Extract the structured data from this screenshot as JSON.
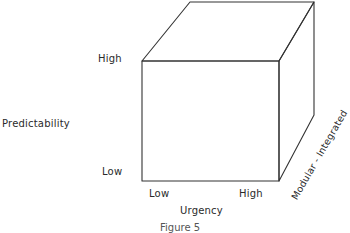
{
  "diagram": {
    "type": "3d-cube-framework",
    "axes": {
      "vertical": {
        "label": "Predictability",
        "low": "Low",
        "high": "High"
      },
      "horizontal": {
        "label": "Urgency",
        "low": "Low",
        "high": "High"
      },
      "depth": {
        "label": "Modular - Integrated"
      }
    },
    "caption": "Figure 5"
  }
}
